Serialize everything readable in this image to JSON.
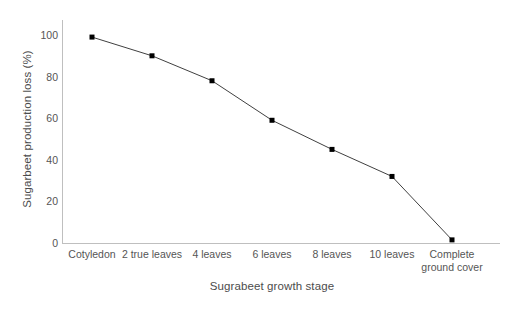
{
  "chart_data": {
    "type": "line",
    "title": "",
    "xlabel": "Sugrabeet growth stage",
    "ylabel": "Sugarbeet production loss (%)",
    "categories": [
      "Cotyledon",
      "2 true leaves",
      "4 leaves",
      "6 leaves",
      "8 leaves",
      "10 leaves",
      "Complete ground cover"
    ],
    "values": [
      99,
      90,
      78,
      59,
      45,
      32,
      1.5
    ],
    "ylim": [
      0,
      100
    ],
    "yticks": [
      0,
      20,
      40,
      60,
      80,
      100
    ],
    "ytick_labels": [
      "0",
      "20",
      "40",
      "60",
      "80",
      "100"
    ],
    "grid": false,
    "legend": "none",
    "series": [
      {
        "name": "Sugarbeet production loss",
        "values": [
          99,
          90,
          78,
          59,
          45,
          32,
          1.5
        ],
        "line_color": "#404040",
        "marker_color": "#000000",
        "marker": "square"
      }
    ],
    "axis_color": "#bfbfbf",
    "text_color": "#555555"
  },
  "axes": {
    "y_title": "Sugarbeet production loss (%)",
    "x_title": "Sugrabeet growth stage"
  },
  "x_labels": [
    {
      "line1": "Cotyledon",
      "line2": ""
    },
    {
      "line1": "2 true leaves",
      "line2": ""
    },
    {
      "line1": "4 leaves",
      "line2": ""
    },
    {
      "line1": "6 leaves",
      "line2": ""
    },
    {
      "line1": "8 leaves",
      "line2": ""
    },
    {
      "line1": "10 leaves",
      "line2": ""
    },
    {
      "line1": "Complete",
      "line2": "ground cover"
    }
  ],
  "y_labels": [
    "100",
    "80",
    "60",
    "40",
    "20",
    "0"
  ]
}
